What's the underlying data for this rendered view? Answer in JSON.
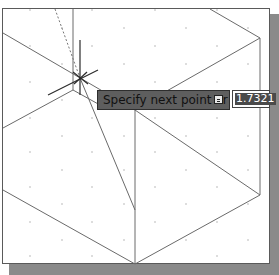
{
  "viewport": {
    "background": "#ffffff",
    "frame_color": "#5a5a5a",
    "shadow_color": "#8a8a8a",
    "grid": "dot-grid",
    "cursor": "crosshair-icon"
  },
  "dynamic_input": {
    "prompt": "Specify next point or",
    "options_button": "down-arrow-options-icon",
    "length_value": "1.7321"
  }
}
